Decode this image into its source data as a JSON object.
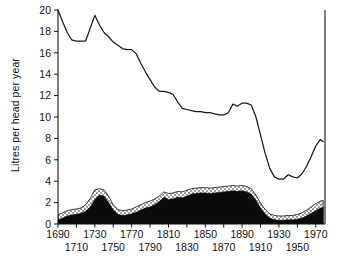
{
  "chart_data": {
    "type": "area",
    "title": "",
    "xlabel": "",
    "ylabel": "Litres per head per year",
    "xlim": [
      1690,
      1980
    ],
    "ylim": [
      0,
      20
    ],
    "grid": false,
    "legend": "none",
    "y_ticks": [
      0,
      2,
      4,
      6,
      8,
      10,
      12,
      14,
      16,
      18,
      20
    ],
    "x_ticks": [
      1690,
      1710,
      1730,
      1750,
      1770,
      1790,
      1810,
      1830,
      1850,
      1870,
      1890,
      1910,
      1930,
      1950,
      1970
    ],
    "x_ticks_upper_row": [
      1690,
      1730,
      1770,
      1810,
      1850,
      1890,
      1930,
      1970
    ],
    "x_ticks_lower_row": [
      1710,
      1750,
      1790,
      1830,
      1870,
      1910,
      1950
    ],
    "series": [
      {
        "name": "upper-line",
        "style": "line",
        "x": [
          1690,
          1695,
          1700,
          1705,
          1710,
          1715,
          1720,
          1725,
          1730,
          1735,
          1740,
          1745,
          1750,
          1755,
          1760,
          1765,
          1770,
          1775,
          1780,
          1785,
          1790,
          1795,
          1800,
          1805,
          1810,
          1815,
          1820,
          1825,
          1830,
          1835,
          1840,
          1845,
          1850,
          1855,
          1860,
          1865,
          1870,
          1875,
          1880,
          1885,
          1890,
          1895,
          1900,
          1905,
          1910,
          1915,
          1920,
          1925,
          1930,
          1935,
          1940,
          1945,
          1950,
          1955,
          1960,
          1965,
          1970,
          1975,
          1978
        ],
        "y": [
          20.0,
          18.9,
          17.9,
          17.2,
          17.1,
          17.1,
          17.1,
          18.3,
          19.5,
          18.6,
          17.9,
          17.5,
          17.0,
          16.7,
          16.4,
          16.3,
          16.3,
          15.9,
          15.0,
          14.2,
          13.5,
          12.8,
          12.4,
          12.4,
          12.3,
          12.1,
          11.4,
          10.8,
          10.7,
          10.6,
          10.5,
          10.5,
          10.4,
          10.4,
          10.3,
          10.2,
          10.2,
          10.4,
          11.2,
          11.0,
          11.3,
          11.3,
          11.1,
          10.0,
          8.3,
          6.6,
          5.2,
          4.4,
          4.2,
          4.2,
          4.6,
          4.4,
          4.3,
          4.7,
          5.4,
          6.3,
          7.3,
          7.9,
          7.7
        ]
      },
      {
        "name": "black-filled-area",
        "style": "filled-black",
        "x": [
          1690,
          1695,
          1700,
          1705,
          1710,
          1715,
          1720,
          1725,
          1730,
          1735,
          1740,
          1745,
          1750,
          1755,
          1760,
          1765,
          1770,
          1775,
          1780,
          1785,
          1790,
          1795,
          1800,
          1805,
          1810,
          1815,
          1820,
          1825,
          1830,
          1835,
          1840,
          1845,
          1850,
          1855,
          1860,
          1865,
          1870,
          1875,
          1880,
          1885,
          1890,
          1895,
          1900,
          1905,
          1910,
          1915,
          1920,
          1925,
          1930,
          1935,
          1940,
          1945,
          1950,
          1955,
          1960,
          1965,
          1970,
          1975,
          1978
        ],
        "y": [
          0.35,
          0.55,
          0.75,
          0.85,
          0.9,
          1.0,
          1.2,
          1.6,
          2.3,
          2.7,
          2.6,
          2.0,
          1.3,
          0.9,
          0.8,
          0.85,
          0.95,
          1.1,
          1.3,
          1.5,
          1.6,
          1.8,
          2.1,
          2.5,
          2.3,
          2.35,
          2.5,
          2.45,
          2.6,
          2.8,
          2.85,
          2.9,
          2.9,
          2.85,
          2.9,
          2.95,
          3.0,
          3.05,
          3.1,
          3.05,
          3.1,
          3.0,
          2.8,
          2.2,
          1.5,
          0.9,
          0.55,
          0.4,
          0.35,
          0.35,
          0.4,
          0.4,
          0.45,
          0.55,
          0.75,
          1.0,
          1.25,
          1.5,
          1.55
        ]
      },
      {
        "name": "stipple-band-top",
        "style": "stippled",
        "x": [
          1690,
          1695,
          1700,
          1705,
          1710,
          1715,
          1720,
          1725,
          1730,
          1735,
          1740,
          1745,
          1750,
          1755,
          1760,
          1765,
          1770,
          1775,
          1780,
          1785,
          1790,
          1795,
          1800,
          1805,
          1810,
          1815,
          1820,
          1825,
          1830,
          1835,
          1840,
          1845,
          1850,
          1855,
          1860,
          1865,
          1870,
          1875,
          1880,
          1885,
          1890,
          1895,
          1900,
          1905,
          1910,
          1915,
          1920,
          1925,
          1930,
          1935,
          1940,
          1945,
          1950,
          1955,
          1960,
          1965,
          1970,
          1975,
          1978
        ],
        "y": [
          0.85,
          1.05,
          1.25,
          1.35,
          1.4,
          1.5,
          1.8,
          2.4,
          3.2,
          3.3,
          3.2,
          2.6,
          1.8,
          1.35,
          1.25,
          1.3,
          1.4,
          1.6,
          1.8,
          2.0,
          2.15,
          2.35,
          2.6,
          3.0,
          2.85,
          2.9,
          3.05,
          3.0,
          3.15,
          3.3,
          3.35,
          3.4,
          3.4,
          3.35,
          3.4,
          3.45,
          3.5,
          3.55,
          3.6,
          3.55,
          3.6,
          3.5,
          3.3,
          2.7,
          1.95,
          1.35,
          0.95,
          0.8,
          0.75,
          0.75,
          0.8,
          0.8,
          0.9,
          1.05,
          1.3,
          1.6,
          1.9,
          2.15,
          2.2
        ]
      }
    ]
  },
  "axis": {
    "y_label": "Litres per head per year"
  }
}
